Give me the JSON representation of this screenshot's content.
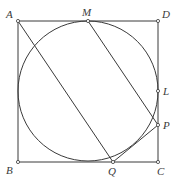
{
  "figure": {
    "type": "geometry-diagram",
    "colors": {
      "stroke": "#3a3a3a",
      "background": "#ffffff"
    }
  },
  "points": {
    "A": {
      "label": "A",
      "x": 18,
      "y": 21
    },
    "B": {
      "label": "B",
      "x": 18,
      "y": 162
    },
    "C": {
      "label": "C",
      "x": 158,
      "y": 162
    },
    "D": {
      "label": "D",
      "x": 158,
      "y": 21
    },
    "M": {
      "label": "M",
      "x": 88,
      "y": 21
    },
    "L": {
      "label": "L",
      "x": 158,
      "y": 91
    },
    "P": {
      "label": "P",
      "x": 158,
      "y": 125
    },
    "Q": {
      "label": "Q",
      "x": 113,
      "y": 162
    }
  },
  "circle": {
    "cx": 88,
    "cy": 91,
    "r": 70
  },
  "segments": [
    [
      "A",
      "B"
    ],
    [
      "B",
      "C"
    ],
    [
      "C",
      "D"
    ],
    [
      "D",
      "A"
    ],
    [
      "A",
      "Q"
    ],
    [
      "M",
      "P"
    ],
    [
      "P",
      "Q"
    ]
  ],
  "labels": {
    "A": "A",
    "B": "B",
    "C": "C",
    "D": "D",
    "M": "M",
    "L": "L",
    "P": "P",
    "Q": "Q"
  }
}
